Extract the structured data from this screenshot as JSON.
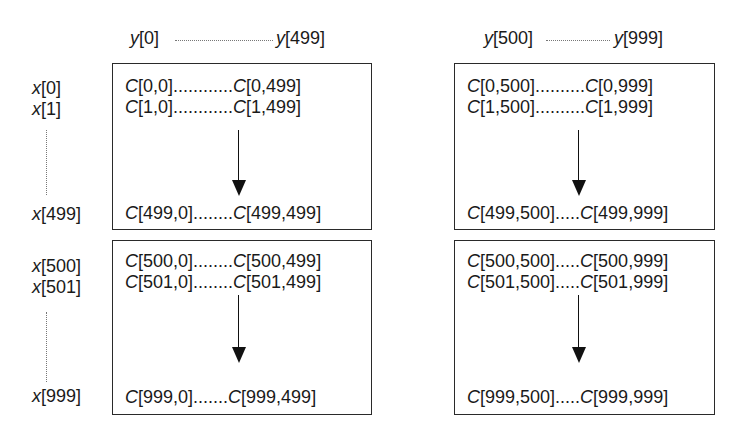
{
  "column_headers": [
    {
      "start_var": "y",
      "start_idx": "[0]",
      "end_var": "y",
      "end_idx": "[499]"
    },
    {
      "start_var": "y",
      "start_idx": "[500]",
      "end_var": "y",
      "end_idx": "[999]"
    }
  ],
  "row_labels": {
    "top": [
      {
        "var": "x",
        "idx": "[0]"
      },
      {
        "var": "x",
        "idx": "[1]"
      },
      {
        "var": "x",
        "idx": "[499]"
      }
    ],
    "bottom": [
      {
        "var": "x",
        "idx": "[500]"
      },
      {
        "var": "x",
        "idx": "[501]"
      },
      {
        "var": "x",
        "idx": "[999]"
      }
    ]
  },
  "blocks": {
    "top_left": {
      "row1": {
        "a": "[0,0]",
        "dots": "............",
        "b": "[0,499]"
      },
      "row2": {
        "a": "[1,0]",
        "dots": "............",
        "b": "[1,499]"
      },
      "row3": {
        "a": "[499,0]",
        "dots": "........",
        "b": "[499,499]"
      }
    },
    "top_right": {
      "row1": {
        "a": "[0,500]",
        "dots": "..........",
        "b": "[0,999]"
      },
      "row2": {
        "a": "[1,500]",
        "dots": "..........",
        "b": "[1,999]"
      },
      "row3": {
        "a": "[499,500]",
        "dots": ".....",
        "b": "[499,999]"
      }
    },
    "bottom_left": {
      "row1": {
        "a": "[500,0]",
        "dots": "........",
        "b": "[500,499]"
      },
      "row2": {
        "a": "[501,0]",
        "dots": "........",
        "b": "[501,499]"
      },
      "row3": {
        "a": "[999,0]",
        "dots": ".......",
        "b": "[999,499]"
      }
    },
    "bottom_right": {
      "row1": {
        "a": "[500,500]",
        "dots": ".....",
        "b": "[500,999]"
      },
      "row2": {
        "a": "[501,500]",
        "dots": ".....",
        "b": "[501,999]"
      },
      "row3": {
        "a": "[999,500]",
        "dots": ".....",
        "b": "[999,999]"
      }
    }
  },
  "matrix_symbol": "C"
}
